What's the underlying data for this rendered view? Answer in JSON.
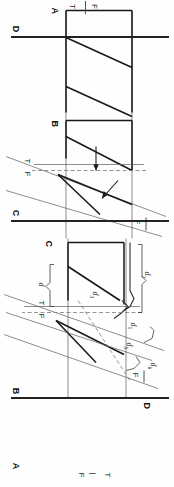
{
  "figure": {
    "orientation_deg": 90,
    "panel_count": 4,
    "background_color": "#fefefe",
    "ink_color": "#1a1a1a"
  },
  "header": {
    "marker_left": "T",
    "marker_right": "F",
    "divider": "|"
  },
  "panels": [
    {
      "id": "A",
      "label": "A",
      "caption_label": "d",
      "description": "undeformed horizontal band with two inclined marker lines"
    },
    {
      "id": "B",
      "label": "B",
      "description": "band offset across an inclined fault with displacement arrows",
      "markers": {
        "t": "T",
        "f": "F",
        "f_right": "F"
      }
    },
    {
      "id": "C",
      "label": "C",
      "description": "band with rotated fault blocks, braces and displacement components",
      "markers": {
        "t": "T",
        "f": "F",
        "f_right": "F"
      },
      "measurements": [
        {
          "name": "d1",
          "base": "d",
          "sub": "1"
        },
        {
          "name": "d2",
          "base": "d",
          "sub": "2"
        },
        {
          "name": "d3",
          "base": "d",
          "sub": "3"
        },
        {
          "name": "d4",
          "base": "d",
          "sub": "4"
        },
        {
          "name": "d5",
          "base": "d",
          "sub": "5"
        },
        {
          "name": "d6",
          "base": "d",
          "sub": "6"
        },
        {
          "name": "d",
          "base": "d",
          "sub": ""
        }
      ]
    },
    {
      "id": "D",
      "label": "D",
      "description": "terminal rule line closing the plate"
    }
  ],
  "colors": {
    "thin_line": "#5c5c5c",
    "medium_line": "#2e2e2e",
    "thick_line": "#171717",
    "dashed_line": "#7a7a7a",
    "rule": "#222222"
  }
}
